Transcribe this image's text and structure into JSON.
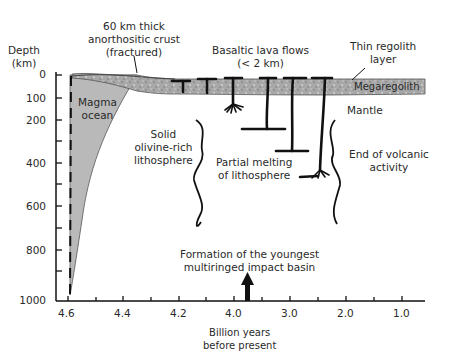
{
  "diagram": {
    "y_axis": {
      "title_line1": "Depth",
      "title_line2": "(km)",
      "ticks": [
        "0",
        "100",
        "200",
        "400",
        "600",
        "800",
        "1000"
      ]
    },
    "x_axis": {
      "title_line1": "Billion years",
      "title_line2": "before present",
      "ticks": [
        "4.6",
        "4.4",
        "4.2",
        "4.0",
        "3.0",
        "2.0",
        "1.0"
      ]
    },
    "labels": {
      "crust_line1": "60 km thick",
      "crust_line2": "anorthositic crust",
      "crust_line3": "(fractured)",
      "lava_line1": "Basaltic lava flows",
      "lava_line2": "(< 2 km)",
      "regolith_line1": "Thin regolith",
      "regolith_line2": "layer",
      "megaregolith": "Megaregolith",
      "magma_line1": "Magma",
      "magma_line2": "ocean",
      "mantle": "Mantle",
      "lithosphere_line1": "Solid",
      "lithosphere_line2": "olivine-rich",
      "lithosphere_line3": "lithosphere",
      "partial_line1": "Partial melting",
      "partial_line2": "of lithosphere",
      "end_line1": "End of volcanic",
      "end_line2": "activity",
      "basin_line1": "Formation of the youngest",
      "basin_line2": "multiringed impact basin"
    },
    "colors": {
      "magma_fill": "#b8b8b8",
      "crust_fill": "#a9a9a9",
      "ink": "#111111"
    }
  }
}
